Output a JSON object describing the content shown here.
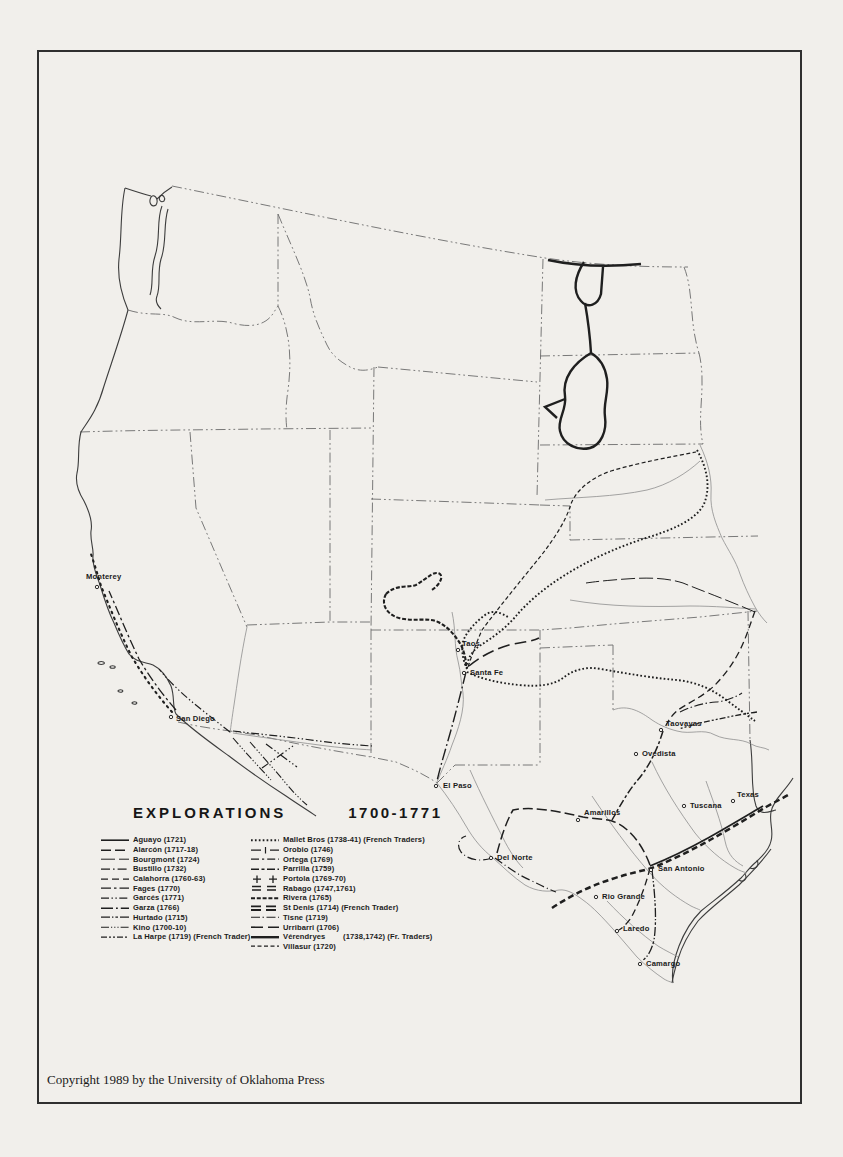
{
  "page": {
    "copyright": "Copyright 1989 by the University of Oklahoma Press"
  },
  "legend": {
    "title": "EXPLORATIONS",
    "period": "1700-1771",
    "columns": [
      {
        "items": [
          {
            "name": "Aguayo",
            "years": "(1721)",
            "note": "",
            "style": "aguayo"
          },
          {
            "name": "Alarcón",
            "years": "(1717-18)",
            "note": "",
            "style": "alarcon"
          },
          {
            "name": "Bourgmont",
            "years": "(1724)",
            "note": "",
            "style": "bourgmont"
          },
          {
            "name": "Bustillo",
            "years": "(1732)",
            "note": "",
            "style": "bustillo"
          },
          {
            "name": "Calahorra",
            "years": "(1760-63)",
            "note": "",
            "style": "calahorra"
          },
          {
            "name": "Fages",
            "years": "(1770)",
            "note": "",
            "style": "fages"
          },
          {
            "name": "Garcés",
            "years": "(1771)",
            "note": "",
            "style": "garces"
          },
          {
            "name": "Garza",
            "years": "(1766)",
            "note": "",
            "style": "garza"
          },
          {
            "name": "Hurtado",
            "years": "(1715)",
            "note": "",
            "style": "hurtado"
          },
          {
            "name": "Kino",
            "years": "(1700-10)",
            "note": "",
            "style": "kino"
          },
          {
            "name": "La Harpe",
            "years": "(1719)",
            "note": "(French Trader)",
            "style": "laharpe"
          }
        ]
      },
      {
        "items": [
          {
            "name": "Mallet Bros",
            "years": "(1738-41)",
            "note": "(French Traders)",
            "style": "mallet"
          },
          {
            "name": "Orobio",
            "years": "(1746)",
            "note": "",
            "style": "orobio"
          },
          {
            "name": "Ortega",
            "years": "(1769)",
            "note": "",
            "style": "ortega"
          },
          {
            "name": "Parrilla",
            "years": "(1759)",
            "note": "",
            "style": "parrilla"
          },
          {
            "name": "Portola",
            "years": "(1769-70)",
            "note": "",
            "style": "portola"
          },
          {
            "name": "Rabago",
            "years": "(1747,1761)",
            "note": "",
            "style": "rabago"
          },
          {
            "name": "Rivera",
            "years": "(1765)",
            "note": "",
            "style": "rivera"
          },
          {
            "name": "St Denis",
            "years": "(1714)",
            "note": "(French Trader)",
            "style": "stdenis"
          },
          {
            "name": "Tisne",
            "years": "(1719)",
            "note": "",
            "style": "tisne"
          },
          {
            "name": "Urribarri",
            "years": "(1706)",
            "note": "",
            "style": "urribarri"
          },
          {
            "name": "Vérendryes",
            "years": "(1738,1742)",
            "note": "(Fr. Traders)",
            "style": "verendryes",
            "gap": true
          },
          {
            "name": "Villasur",
            "years": "(1720)",
            "note": "",
            "style": "villasur"
          }
        ]
      }
    ]
  },
  "map": {
    "places": [
      {
        "name": "Monterey",
        "x": 86,
        "y": 579,
        "mx": 97,
        "my": 587
      },
      {
        "name": "San Diego",
        "x": 176,
        "y": 721,
        "mx": 171,
        "my": 717
      },
      {
        "name": "Taos",
        "x": 462,
        "y": 646,
        "mx": 458,
        "my": 650
      },
      {
        "name": "Santa Fe",
        "x": 470,
        "y": 675,
        "mx": 464,
        "my": 673
      },
      {
        "name": "El Paso",
        "x": 443,
        "y": 788,
        "mx": 436,
        "my": 786
      },
      {
        "name": "Taovayas",
        "x": 666,
        "y": 726,
        "mx": 661,
        "my": 730
      },
      {
        "name": "Ovedista",
        "x": 642,
        "y": 756,
        "mx": 636,
        "my": 754
      },
      {
        "name": "Tuscana",
        "x": 690,
        "y": 808,
        "mx": 684,
        "my": 806
      },
      {
        "name": "Texas",
        "x": 737,
        "y": 797,
        "mx": 733,
        "my": 801
      },
      {
        "name": "Amarillos",
        "x": 584,
        "y": 815,
        "mx": 578,
        "my": 820
      },
      {
        "name": "Del Norte",
        "x": 497,
        "y": 860,
        "mx": 491,
        "my": 858
      },
      {
        "name": "San Antonio",
        "x": 658,
        "y": 871,
        "mx": 651,
        "my": 870
      },
      {
        "name": "Rio Grande",
        "x": 602,
        "y": 899,
        "mx": 596,
        "my": 897
      },
      {
        "name": "Laredo",
        "x": 623,
        "y": 931,
        "mx": 617,
        "my": 931
      },
      {
        "name": "Camargo",
        "x": 646,
        "y": 966,
        "mx": 640,
        "my": 964
      }
    ]
  },
  "colors": {
    "paper": "#f1efeb",
    "frame": "#2f2f2f",
    "route_ink": "#1f1f1f",
    "border_ink": "#6b6b6b"
  }
}
